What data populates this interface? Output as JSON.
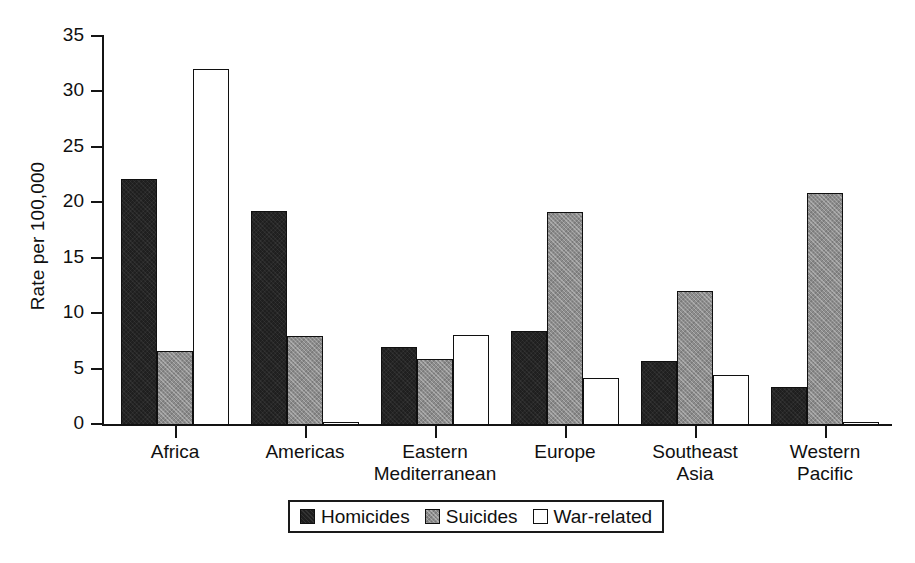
{
  "chart_data": {
    "type": "bar",
    "title": "",
    "xlabel": "",
    "ylabel": "Rate per 100,000",
    "ylim": [
      0,
      35
    ],
    "yticks": [
      0,
      5,
      10,
      15,
      20,
      25,
      30,
      35
    ],
    "ytick_labels": [
      "0",
      "5",
      "10",
      "15",
      "20",
      "25",
      "30",
      "35"
    ],
    "grid": false,
    "legend_position": "bottom-center",
    "categories": [
      "Africa",
      "Americas",
      "Eastern Mediterranean",
      "Europe",
      "Southeast Asia",
      "Western Pacific"
    ],
    "category_lines": [
      [
        "Africa",
        ""
      ],
      [
        "Americas",
        ""
      ],
      [
        "Eastern",
        "Mediterranean"
      ],
      [
        "Europe",
        ""
      ],
      [
        "Southeast",
        "Asia"
      ],
      [
        "Western",
        "Pacific"
      ]
    ],
    "series": [
      {
        "name": "Homicides",
        "key": "homicides",
        "color": "#1f1f1f",
        "values": [
          22.2,
          19.3,
          7.0,
          8.5,
          5.8,
          3.4
        ]
      },
      {
        "name": "Suicides",
        "key": "suicides",
        "color": "#8c8c8c",
        "values": [
          6.7,
          8.0,
          6.0,
          19.2,
          12.1,
          20.9
        ]
      },
      {
        "name": "War-related",
        "key": "war-related",
        "color": "#ffffff",
        "values": [
          32.1,
          0.3,
          8.1,
          4.2,
          4.5,
          0.2
        ]
      }
    ]
  },
  "legend": {
    "entries": [
      {
        "label": "Homicides",
        "key": "homicides"
      },
      {
        "label": "Suicides",
        "key": "suicides"
      },
      {
        "label": "War-related",
        "key": "war-related"
      }
    ]
  }
}
